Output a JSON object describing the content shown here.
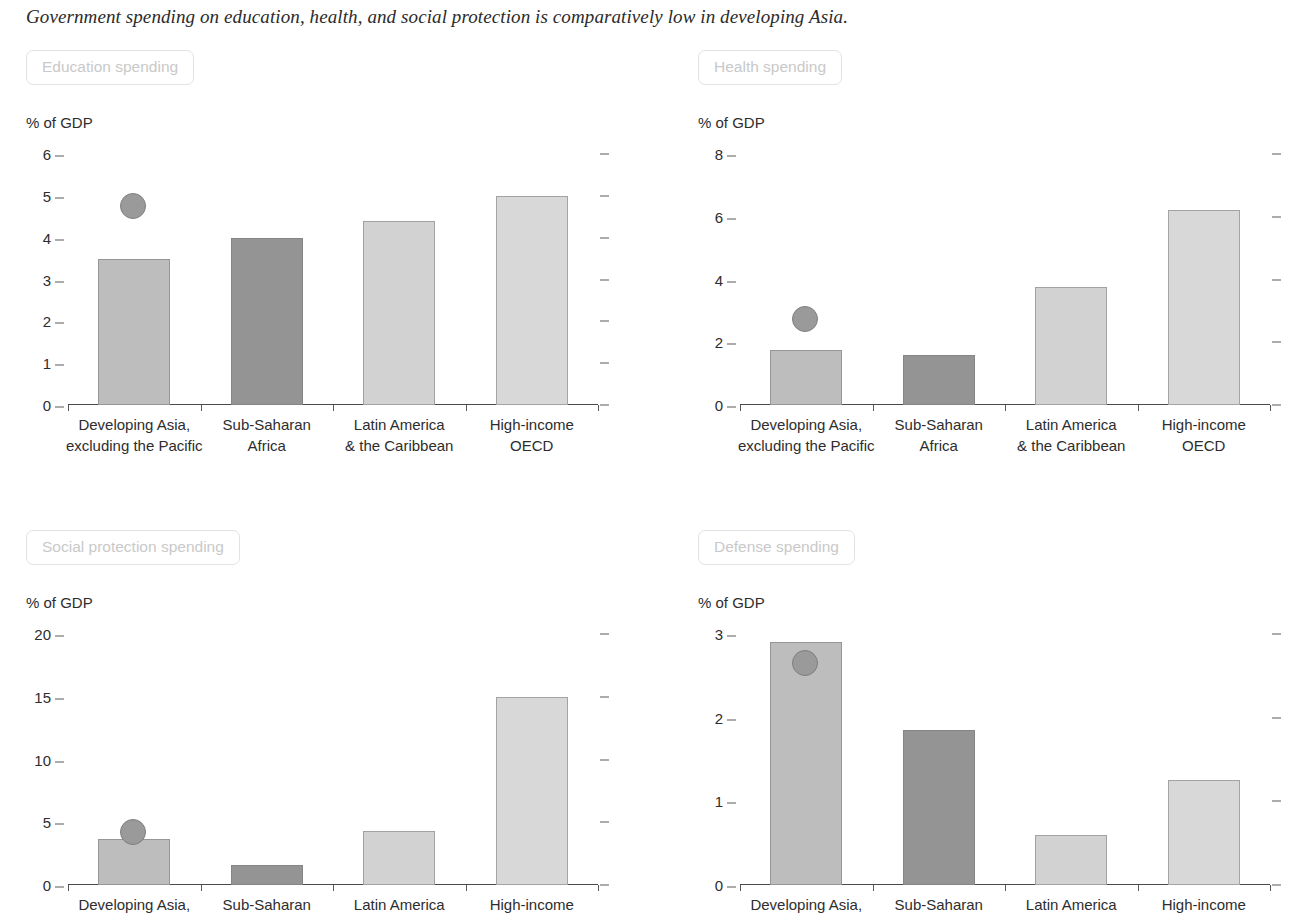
{
  "figure": {
    "title": "Government spending on education, health, and social protection is comparatively low in developing Asia."
  },
  "categories": [
    {
      "line1": "Developing Asia,",
      "line2": "excluding the Pacific"
    },
    {
      "line1": "Sub-Saharan",
      "line2": "Africa"
    },
    {
      "line1": "Latin America",
      "line2": "& the Caribbean"
    },
    {
      "line1": "High-income",
      "line2": "OECD"
    }
  ],
  "colors": {
    "bar_developing_asia": "#bdbdbd",
    "bar_sub_saharan": "#949494",
    "bar_latin_america": "#d2d2d2",
    "bar_high_income": "#d8d8d8",
    "marker": "#9a9a9a",
    "axis": "#4a4a4a",
    "pill_text": "#c9c9c9",
    "pill_border": "#e2e2e2",
    "title_text": "#2b2b2b"
  },
  "panels": [
    {
      "pill_label": "Education spending",
      "unit_label": "% of GDP",
      "show_second_label_line": true
    },
    {
      "pill_label": "Health spending",
      "unit_label": "% of GDP",
      "show_second_label_line": true
    },
    {
      "pill_label": "Social protection spending",
      "unit_label": "% of GDP",
      "show_second_label_line": false
    },
    {
      "pill_label": "Defense spending",
      "unit_label": "% of GDP",
      "show_second_label_line": false
    }
  ],
  "chart_data": [
    {
      "type": "bar",
      "title": "Education spending",
      "xlabel": "",
      "ylabel": "% of GDP",
      "categories": [
        "Developing Asia, excluding the Pacific",
        "Sub-Saharan Africa",
        "Latin America & the Caribbean",
        "High-income OECD"
      ],
      "values": [
        3.5,
        4.0,
        4.4,
        5.0
      ],
      "ylim": [
        0,
        6
      ],
      "yticks": [
        0,
        1,
        2,
        3,
        4,
        5,
        6
      ],
      "grid": false,
      "legend": "none",
      "annotations": [
        {
          "name": "developing-asia-marker",
          "category": "Developing Asia, excluding the Pacific",
          "value": 4.75,
          "shape": "circle"
        }
      ]
    },
    {
      "type": "bar",
      "title": "Health spending",
      "xlabel": "",
      "ylabel": "% of GDP",
      "categories": [
        "Developing Asia, excluding the Pacific",
        "Sub-Saharan Africa",
        "Latin America & the Caribbean",
        "High-income OECD"
      ],
      "values": [
        1.75,
        1.6,
        3.75,
        6.2
      ],
      "ylim": [
        0,
        8
      ],
      "yticks": [
        0,
        2,
        4,
        6,
        8
      ],
      "grid": false,
      "legend": "none",
      "annotations": [
        {
          "name": "developing-asia-marker",
          "category": "Developing Asia, excluding the Pacific",
          "value": 2.75,
          "shape": "circle"
        }
      ]
    },
    {
      "type": "bar",
      "title": "Social protection spending",
      "xlabel": "",
      "ylabel": "% of GDP",
      "categories": [
        "Developing Asia, excluding the Pacific",
        "Sub-Saharan Africa",
        "Latin America & the Caribbean",
        "High-income OECD"
      ],
      "values": [
        3.7,
        1.6,
        4.3,
        15.0
      ],
      "ylim": [
        0,
        20
      ],
      "yticks": [
        0,
        5,
        10,
        15,
        20
      ],
      "grid": false,
      "legend": "none",
      "annotations": [
        {
          "name": "developing-asia-marker",
          "category": "Developing Asia, excluding the Pacific",
          "value": 4.2,
          "shape": "circle"
        }
      ]
    },
    {
      "type": "bar",
      "title": "Defense spending",
      "xlabel": "",
      "ylabel": "% of GDP",
      "categories": [
        "Developing Asia, excluding the Pacific",
        "Sub-Saharan Africa",
        "Latin America & the Caribbean",
        "High-income OECD"
      ],
      "values": [
        2.9,
        1.85,
        0.6,
        1.25
      ],
      "ylim": [
        0,
        3
      ],
      "yticks": [
        0,
        1,
        2,
        3
      ],
      "grid": false,
      "legend": "none",
      "annotations": [
        {
          "name": "developing-asia-marker",
          "category": "Developing Asia, excluding the Pacific",
          "value": 2.65,
          "shape": "circle"
        }
      ]
    }
  ]
}
